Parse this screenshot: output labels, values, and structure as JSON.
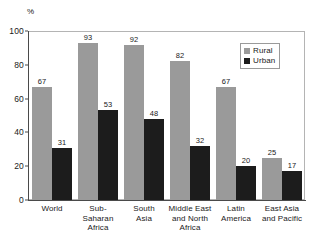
{
  "chart_data": {
    "type": "bar",
    "title": "",
    "subtitle": "",
    "xlabel": "",
    "ylabel": "%",
    "unit_label": "%",
    "ylim": [
      0,
      100
    ],
    "yticks": [
      0,
      20,
      40,
      60,
      80,
      100
    ],
    "ytick_labels": [
      "0",
      "20",
      "40",
      "60",
      "80",
      "100"
    ],
    "grid": false,
    "legend_position": "top-right-inside",
    "categories": [
      "World",
      "Sub-Saharan Africa",
      "South Asia",
      "Middle East and North Africa",
      "Latin America",
      "East Asia and Pacific"
    ],
    "category_label_lines": [
      [
        "World"
      ],
      [
        "Sub-",
        "Saharan",
        "Africa"
      ],
      [
        "South",
        "Asia"
      ],
      [
        "Middle East",
        "and North",
        "Africa"
      ],
      [
        "Latin",
        "America"
      ],
      [
        "East Asia",
        "and Pacific"
      ]
    ],
    "series": [
      {
        "name": "Rural",
        "color": "#9a9a9a",
        "values": [
          67,
          93,
          92,
          82,
          67,
          25
        ]
      },
      {
        "name": "Urban",
        "color": "#1c1c1c",
        "values": [
          31,
          53,
          48,
          32,
          20,
          17
        ]
      }
    ],
    "annotations": []
  },
  "legend": {
    "items": [
      {
        "label": "Rural",
        "color": "#9a9a9a"
      },
      {
        "label": "Urban",
        "color": "#1c1c1c"
      }
    ]
  },
  "colors": {
    "rural": "#9a9a9a",
    "urban": "#1c1c1c",
    "axis": "#4a4a4a",
    "frame": "#b4b4b4",
    "text": "#1a1a1a",
    "background": "#ffffff"
  }
}
